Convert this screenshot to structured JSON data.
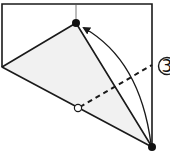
{
  "diagram": {
    "type": "origami-fold-step",
    "step_number_label": "3",
    "step_number_glyph": "③",
    "colors": {
      "line": "#1a1a1a",
      "fill": "#f1f1f1",
      "background": "#ffffff"
    },
    "elements": {
      "paper_outline": "rectangle-edges",
      "folded_flap": "shaded-triangle",
      "fold_line": "dashed-valley-fold",
      "move_arrow": "curved-arrow",
      "start_point": "filled-dot-bottom-right",
      "target_point": "filled-dot-top",
      "reference_point": "hollow-circle-on-edge"
    }
  }
}
